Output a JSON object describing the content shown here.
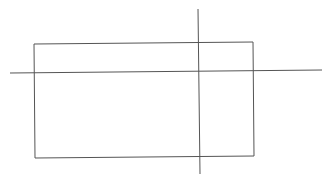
{
  "canvas": {
    "width": 331,
    "height": 182,
    "background": "#ffffff"
  },
  "stroke_color": "#555555",
  "shapes": {
    "rectangle": {
      "points": "34,44 253,42 254,156 35,158"
    },
    "horizontal_line": {
      "x1": 10,
      "y1": 73,
      "x2": 322,
      "y2": 70
    },
    "vertical_line": {
      "x1": 198,
      "y1": 9,
      "x2": 200,
      "y2": 174
    }
  }
}
